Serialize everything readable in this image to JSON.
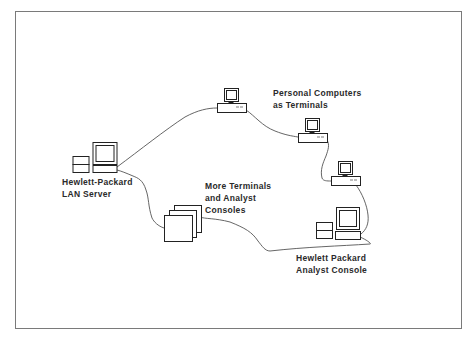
{
  "diagram": {
    "type": "network",
    "nodes": [
      {
        "id": "lan_server",
        "label_lines": [
          "Hewlett-Packard",
          "LAN Server"
        ],
        "icon": "server-workstation-icon"
      },
      {
        "id": "pc1",
        "label_lines": [],
        "icon": "personal-computer-icon"
      },
      {
        "id": "pc2",
        "label_lines": [],
        "icon": "personal-computer-icon"
      },
      {
        "id": "pc3",
        "label_lines": [],
        "icon": "personal-computer-icon"
      },
      {
        "id": "analyst_console",
        "label_lines": [
          "Hewlett Packard",
          "Analyst Console"
        ],
        "icon": "analyst-workstation-icon"
      },
      {
        "id": "more_terminals",
        "label_lines": [
          "More Terminals",
          "and Analyst",
          "Consoles"
        ],
        "icon": "stacked-terminals-icon"
      }
    ],
    "group_labels": [
      {
        "id": "pcs_label",
        "label_lines": [
          "Personal Computers",
          "as Terminals"
        ]
      }
    ],
    "edges": [
      [
        "lan_server",
        "pc1"
      ],
      [
        "pc1",
        "pc2"
      ],
      [
        "pc2",
        "pc3"
      ],
      [
        "pc3",
        "analyst_console"
      ],
      [
        "analyst_console",
        "more_terminals"
      ],
      [
        "more_terminals",
        "lan_server"
      ]
    ],
    "colors": {
      "line": "#555555",
      "stroke": "#222222",
      "frame": "#7a7a7a"
    }
  },
  "labels": {
    "pcs": [
      "Personal Computers",
      "as Terminals"
    ],
    "lan_server": [
      "Hewlett-Packard",
      "LAN Server"
    ],
    "more_terminals": [
      "More Terminals",
      "and Analyst",
      "Consoles"
    ],
    "analyst_console": [
      "Hewlett Packard",
      "Analyst Console"
    ]
  }
}
